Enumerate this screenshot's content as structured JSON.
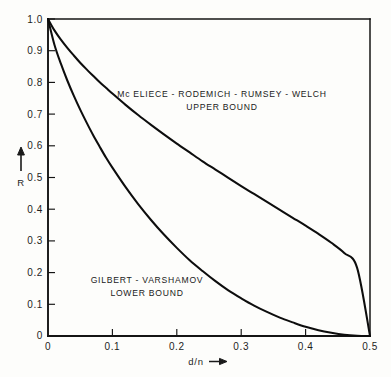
{
  "chart_data": {
    "type": "line",
    "title": "",
    "subtitle": "",
    "xlabel": "d/n",
    "ylabel": "R",
    "xlabel_arrow": "⟶",
    "ylabel_arrow": "↑",
    "xlim": [
      0,
      0.5
    ],
    "ylim": [
      0,
      1.0
    ],
    "grid": false,
    "legend_position": "inline-annotations",
    "x_ticks": [
      0,
      0.1,
      0.2,
      0.3,
      0.4,
      0.5
    ],
    "x_tick_labels": [
      "0",
      "0.1",
      "0.2",
      "0.3",
      "0.4",
      "0.5"
    ],
    "y_ticks": [
      0,
      0.1,
      0.2,
      0.3,
      0.4,
      0.5,
      0.6,
      0.7,
      0.8,
      0.9,
      1.0
    ],
    "y_tick_labels": [
      "0",
      "0.1",
      "0.2",
      "0.3",
      "0.4",
      "0.5",
      "0.6",
      "0.7",
      "0.8",
      "0.9",
      "1.0"
    ],
    "origin_label": "0",
    "series": [
      {
        "name": "McEliece - Rodemich - Rumsey - Welch upper bound",
        "color": "#0d0d0d",
        "x": [
          0.0,
          0.01,
          0.02,
          0.03,
          0.04,
          0.05,
          0.06,
          0.07,
          0.08,
          0.09,
          0.1,
          0.12,
          0.14,
          0.16,
          0.18,
          0.2,
          0.22,
          0.24,
          0.26,
          0.28,
          0.3,
          0.32,
          0.34,
          0.36,
          0.38,
          0.4,
          0.42,
          0.44,
          0.46,
          0.48,
          0.5
        ],
        "values": [
          1.0,
          0.964,
          0.935,
          0.909,
          0.885,
          0.862,
          0.841,
          0.821,
          0.801,
          0.783,
          0.765,
          0.73,
          0.697,
          0.666,
          0.636,
          0.607,
          0.579,
          0.551,
          0.525,
          0.499,
          0.473,
          0.448,
          0.423,
          0.398,
          0.373,
          0.348,
          0.322,
          0.294,
          0.262,
          0.215,
          0.0
        ]
      },
      {
        "name": "Gilbert - Varshamov lower bound",
        "color": "#0d0d0d",
        "x": [
          0.0,
          0.01,
          0.02,
          0.03,
          0.04,
          0.05,
          0.06,
          0.07,
          0.08,
          0.09,
          0.1,
          0.12,
          0.14,
          0.16,
          0.18,
          0.2,
          0.22,
          0.24,
          0.26,
          0.28,
          0.3,
          0.32,
          0.34,
          0.36,
          0.38,
          0.4,
          0.42,
          0.44,
          0.46,
          0.48,
          0.5
        ],
        "values": [
          1.0,
          0.919,
          0.859,
          0.806,
          0.758,
          0.714,
          0.673,
          0.634,
          0.598,
          0.563,
          0.531,
          0.471,
          0.416,
          0.366,
          0.32,
          0.278,
          0.239,
          0.205,
          0.173,
          0.144,
          0.119,
          0.096,
          0.076,
          0.058,
          0.043,
          0.029,
          0.018,
          0.01,
          0.004,
          0.001,
          0.0
        ]
      }
    ],
    "annotations": [
      {
        "name": "upper-bound-label",
        "lines": [
          "Mc ELIECE - RODEMICH - RUMSEY - WELCH",
          "UPPER BOUND"
        ],
        "x": 0.27,
        "y": 0.76
      },
      {
        "name": "lower-bound-label",
        "lines": [
          "GILBERT - VARSHAMOV",
          "LOWER BOUND"
        ],
        "x": 0.185,
        "y": 0.175
      }
    ]
  }
}
